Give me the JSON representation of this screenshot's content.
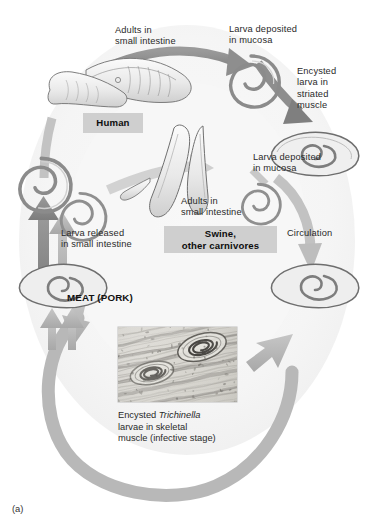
{
  "figure": {
    "panel_label": "(a)",
    "title_absent": true,
    "background_color": "#ffffff",
    "cycle_ring_color": "#e6e6e6",
    "arrow_color_light": "#b9b9b9",
    "arrow_color_dark": "#8b8b8b",
    "chip_background": "#cfcfcf"
  },
  "labels": {
    "adults_human": "Adults in\nsmall intestine",
    "larva_mucosa_top": "Larva deposited\nin mucosa",
    "encysted_striated": "Encysted\nlarva in\nstriated\nmuscle",
    "larva_mucosa_right": "Larva deposited\nin mucosa",
    "adults_swine": "Adults in\nsmall intestine",
    "circulation": "Circulation",
    "larva_released": "Larva released\nin small intestine",
    "meat_pork": "MEAT (PORK)"
  },
  "chips": {
    "human": "Human",
    "swine": "Swine,\nother carnivores"
  },
  "micrograph": {
    "caption_line1_pre": "Encysted ",
    "caption_line1_italic": "Trichinella",
    "caption_line2": "larvae in skeletal",
    "caption_line3": "muscle (infective stage)",
    "alt": "Light micrograph of encysted Trichinella larvae coiled within striated skeletal muscle fibers"
  },
  "icons": {
    "adult_worm_human": "adult-nematode-worm",
    "coiled_larva": "coiled-larva",
    "encysted_cyst": "encysted-larva-in-cyst",
    "adult_worm_swine": "adult-nematode-worm-pair"
  }
}
